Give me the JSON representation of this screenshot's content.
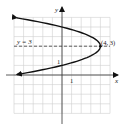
{
  "chart_data": {
    "type": "line",
    "title": "",
    "xlabel": "x",
    "ylabel": "y",
    "xlim": [
      -5,
      5
    ],
    "ylim": [
      -4,
      6
    ],
    "grid": true,
    "tick_labels": {
      "x": [
        "1"
      ],
      "y": [
        "1"
      ]
    },
    "equation": "x = -(y - 3)^2 + 4",
    "series": [
      {
        "name": "parabola",
        "points": [
          [
            -5,
            6
          ],
          [
            -2,
            5.45
          ],
          [
            0,
            5
          ],
          [
            3,
            4
          ],
          [
            4,
            3
          ],
          [
            3,
            2
          ],
          [
            0,
            1
          ],
          [
            -2,
            0.55
          ],
          [
            -5,
            0
          ]
        ]
      }
    ],
    "axis_of_symmetry": {
      "label": "y = 3",
      "y": 3,
      "style": "dashed"
    },
    "annotations": [
      {
        "text": "(4, 3)",
        "x": 4,
        "y": 3
      },
      {
        "text": "y = 3",
        "x": -4.6,
        "y": 3.3
      }
    ]
  },
  "labels": {
    "x_axis": "x",
    "y_axis": "y",
    "x_tick": "1",
    "y_tick": "1",
    "vertex": "(4, 3)",
    "symmetry": "y = 3"
  }
}
